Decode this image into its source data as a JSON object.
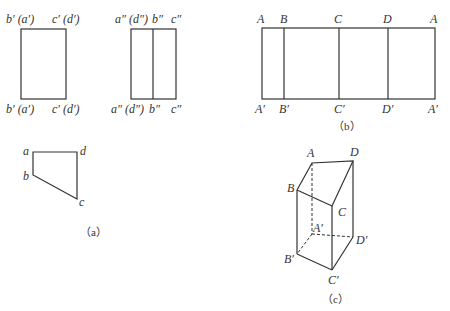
{
  "figure_a": {
    "caption": "（a）",
    "front_view": {
      "top_left": "b′ (a′)",
      "top_right": "c′ (d′)",
      "bottom_left": "b′ (a′)",
      "bottom_right": "c′ (d′)"
    },
    "side_view": {
      "top_left": "a″ (d″)",
      "top_mid": "b″",
      "top_right": "c″",
      "bottom_left": "a″ (d″)",
      "bottom_mid": "b″",
      "bottom_right": "c″"
    },
    "top_view": {
      "a": "a",
      "b": "b",
      "c": "c",
      "d": "d"
    }
  },
  "figure_b": {
    "caption": "（b）",
    "top_labels": [
      "A",
      "B",
      "C",
      "D",
      "A"
    ],
    "bottom_labels": [
      "A′",
      "B′",
      "C′",
      "D′",
      "A′"
    ]
  },
  "figure_c": {
    "caption": "（c）",
    "vertices": {
      "A": "A",
      "B": "B",
      "C": "C",
      "D": "D",
      "A1": "A′",
      "B1": "B′",
      "C1": "C′",
      "D1": "D′"
    }
  }
}
